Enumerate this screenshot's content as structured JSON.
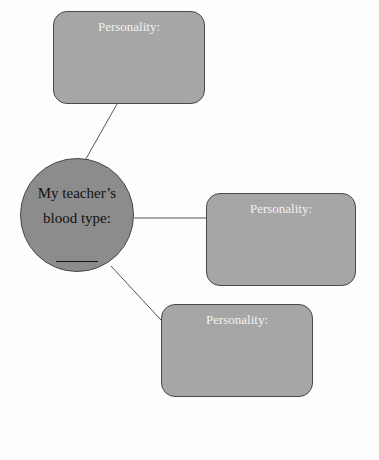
{
  "center": {
    "line1": "My teacher’s",
    "line2": "blood type:",
    "blank": "______"
  },
  "boxes": [
    {
      "label": "Personality:"
    },
    {
      "label": "Personality:"
    },
    {
      "label": "Personality:"
    }
  ],
  "colors": {
    "box_fill": "#a6a6a6",
    "circle_fill": "#8c8c8c",
    "border": "#4a4a4a",
    "box_text": "#f2f2f2"
  }
}
